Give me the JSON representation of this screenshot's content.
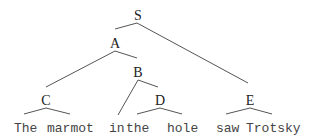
{
  "tree": {
    "nodes": {
      "S": "S",
      "A": "A",
      "B": "B",
      "C": "C",
      "D": "D",
      "E": "E"
    },
    "words": [
      "The",
      "marmot",
      "in",
      "the",
      "hole",
      "saw",
      "Trotsky"
    ],
    "structure": "[S [A [C The marmot] [B in [D the hole]]] [E saw Trotsky]]"
  }
}
